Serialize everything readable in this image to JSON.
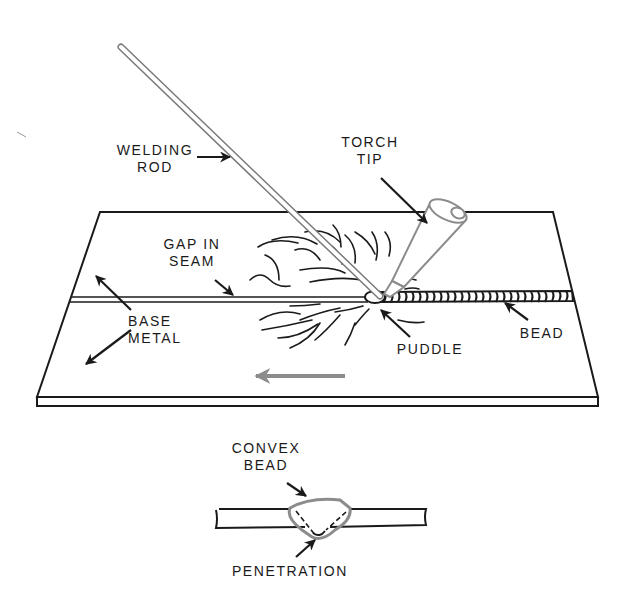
{
  "diagram": {
    "labels": {
      "welding_rod": [
        "WELDING",
        "ROD"
      ],
      "torch_tip": [
        "TORCH",
        "TIP"
      ],
      "gap_in_seam": [
        "GAP IN",
        "SEAM"
      ],
      "base_metal": [
        "BASE",
        "METAL"
      ],
      "puddle": [
        "PUDDLE"
      ],
      "bead": [
        "BEAD"
      ],
      "convex_bead": [
        "CONVEX",
        "BEAD"
      ],
      "penetration": [
        "PENETRATION"
      ]
    },
    "parts": [
      {
        "name": "welding-rod",
        "label": "WELDING ROD"
      },
      {
        "name": "torch-tip",
        "label": "TORCH TIP"
      },
      {
        "name": "gap-in-seam",
        "label": "GAP IN SEAM"
      },
      {
        "name": "base-metal",
        "label": "BASE METAL"
      },
      {
        "name": "puddle",
        "label": "PUDDLE"
      },
      {
        "name": "bead",
        "label": "BEAD"
      }
    ],
    "cross_section": {
      "labels": [
        "CONVEX BEAD",
        "PENETRATION"
      ]
    },
    "direction_arrow": {
      "direction": "left",
      "color": "#8c8c8c"
    },
    "colors": {
      "line": "#1a1a1a",
      "gray": "#8c8c8c",
      "background": "#ffffff"
    }
  }
}
